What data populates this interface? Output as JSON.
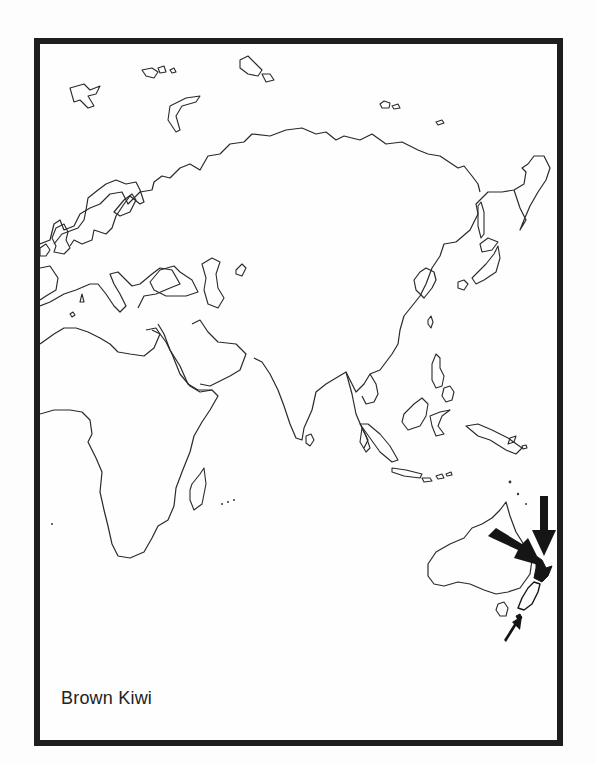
{
  "map": {
    "title": "Brown Kiwi",
    "region": "Eurasia, Africa and Oceania outline map",
    "highlight": {
      "location": "New Zealand",
      "marker_style": "filled black (North Island) with pointing arrows",
      "arrows": [
        {
          "from": "north",
          "size": "large"
        },
        {
          "from": "northwest",
          "size": "large"
        },
        {
          "from": "south",
          "size": "small"
        }
      ]
    },
    "colors": {
      "outline": "#2a2a2a",
      "frame": "#1e1e1e",
      "background": "#fefefe",
      "highlight": "#151515"
    }
  }
}
